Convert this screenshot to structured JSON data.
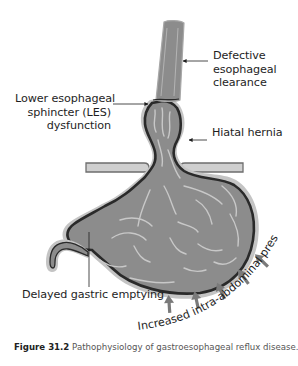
{
  "diagram": {
    "title": "Pathophysiology of gastroesophageal reflux disease",
    "labels": {
      "defective_clearance": [
        "Defective",
        "esophageal",
        "clearance"
      ],
      "les_dysfunction": [
        "Lower esophageal",
        "sphincter (LES)",
        "dysfunction"
      ],
      "hiatal_hernia": "Hiatal hernia",
      "delayed_emptying": "Delayed gastric emptying",
      "intra_abdominal_pressure": "Increased intra-abdominal pressure"
    },
    "structures": [
      "esophagus",
      "lower-esophageal-sphincter",
      "hiatal-hernia",
      "diaphragm",
      "stomach",
      "duodenum"
    ],
    "pressure_arrow_count": 5,
    "colors": {
      "organ_fill": "#8c8c8c",
      "organ_outline": "#2a2a2a",
      "organ_halo": "#c4c4c4",
      "diaphragm_fill": "#cfcfcf",
      "diaphragm_stroke": "#6e6e6e",
      "arrow_fill": "#7a7a7a",
      "fold_highlight": "#c8c8c8"
    }
  },
  "caption": {
    "figure_number": "Figure 31.2",
    "text": "Pathophysiology of gastroesophageal reflux disease."
  }
}
